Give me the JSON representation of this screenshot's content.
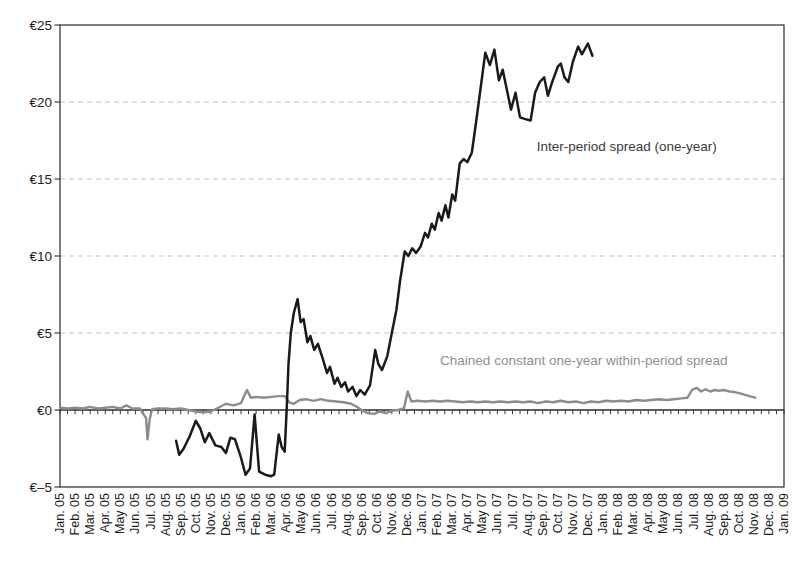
{
  "figure": {
    "background": "#ffffff"
  },
  "chart_data": {
    "type": "line",
    "title": "",
    "xlabel": "",
    "ylabel": "",
    "legend_position": "inline-annotations",
    "grid": "horizontal-dashed",
    "x_axis": {
      "unit": "month",
      "range_months": [
        0,
        48
      ],
      "minor_ticks_per_month": 2,
      "tick_labels": [
        "Jan. 05",
        "Feb. 05",
        "Mar. 05",
        "Apr. 05",
        "May 05",
        "Jun. 05",
        "Jul. 05",
        "Aug. 05",
        "Sep. 05",
        "Oct. 05",
        "Nov. 05",
        "Dec. 05",
        "Jan. 06",
        "Feb. 06",
        "Mar. 06",
        "Apr. 06",
        "May 06",
        "Jun. 06",
        "Jul. 06",
        "Aug. 06",
        "Sep. 06",
        "Oct. 06",
        "Nov. 06",
        "Dec. 06",
        "Jan. 07",
        "Feb. 07",
        "Mar. 07",
        "Apr. 07",
        "May 07",
        "Jun. 07",
        "Jul. 07",
        "Aug. 07",
        "Sep. 07",
        "Oct. 07",
        "Nov. 07",
        "Dec. 07",
        "Jan. 08",
        "Feb. 08",
        "Mar. 08",
        "Apr. 08",
        "May 08",
        "Jun. 08",
        "Jul. 08",
        "Aug. 08",
        "Sep. 08",
        "Oct. 08",
        "Nov. 08",
        "Dec. 08",
        "Jan. 09"
      ]
    },
    "y_axis": {
      "range": [
        -5,
        25
      ],
      "tick_values": [
        -5,
        0,
        5,
        10,
        15,
        20,
        25
      ],
      "tick_labels": [
        "€–5",
        "€0",
        "€5",
        "€10",
        "€15",
        "€20",
        "€25"
      ],
      "gridline_values": [
        5,
        10,
        15,
        20
      ],
      "zero_axis_value": 0
    },
    "series": [
      {
        "key": "within_period",
        "name": "Chained constant one-year within-period spread",
        "color": "#8c8c8c",
        "width": 2.4,
        "points": [
          [
            0,
            0.15
          ],
          [
            0.5,
            0.1
          ],
          [
            1,
            0.15
          ],
          [
            1.5,
            0.1
          ],
          [
            2,
            0.2
          ],
          [
            2.5,
            0.1
          ],
          [
            3,
            0.15
          ],
          [
            3.5,
            0.2
          ],
          [
            4,
            0.1
          ],
          [
            4.4,
            0.3
          ],
          [
            4.8,
            0.1
          ],
          [
            5.3,
            0.1
          ],
          [
            5.55,
            -0.3
          ],
          [
            5.7,
            -0.5
          ],
          [
            5.8,
            -1.9
          ],
          [
            5.95,
            -0.6
          ],
          [
            6.1,
            0.05
          ],
          [
            6.5,
            0.1
          ],
          [
            7,
            0.1
          ],
          [
            7.5,
            0.05
          ],
          [
            8,
            0.1
          ],
          [
            8.5,
            0
          ],
          [
            9,
            -0.1
          ],
          [
            9.5,
            -0.15
          ],
          [
            10,
            -0.1
          ],
          [
            10.5,
            0.15
          ],
          [
            11,
            0.4
          ],
          [
            11.5,
            0.3
          ],
          [
            12,
            0.45
          ],
          [
            12.4,
            1.3
          ],
          [
            12.65,
            0.8
          ],
          [
            13,
            0.85
          ],
          [
            13.5,
            0.8
          ],
          [
            14,
            0.85
          ],
          [
            14.5,
            0.9
          ],
          [
            14.9,
            0.9
          ],
          [
            15.2,
            0.5
          ],
          [
            15.5,
            0.4
          ],
          [
            15.9,
            0.65
          ],
          [
            16.3,
            0.7
          ],
          [
            16.8,
            0.6
          ],
          [
            17.3,
            0.7
          ],
          [
            17.8,
            0.6
          ],
          [
            18.3,
            0.55
          ],
          [
            18.8,
            0.5
          ],
          [
            19.3,
            0.4
          ],
          [
            19.7,
            0.2
          ],
          [
            20,
            0
          ],
          [
            20.4,
            -0.2
          ],
          [
            20.8,
            -0.25
          ],
          [
            21.2,
            -0.1
          ],
          [
            21.6,
            -0.2
          ],
          [
            22,
            -0.05
          ],
          [
            22.4,
            0
          ],
          [
            22.8,
            0.1
          ],
          [
            23.05,
            1.2
          ],
          [
            23.3,
            0.55
          ],
          [
            23.7,
            0.6
          ],
          [
            24.2,
            0.55
          ],
          [
            24.7,
            0.6
          ],
          [
            25.2,
            0.55
          ],
          [
            25.7,
            0.6
          ],
          [
            26.2,
            0.55
          ],
          [
            26.7,
            0.5
          ],
          [
            27.2,
            0.55
          ],
          [
            27.7,
            0.5
          ],
          [
            28.2,
            0.55
          ],
          [
            28.7,
            0.5
          ],
          [
            29.2,
            0.55
          ],
          [
            29.7,
            0.5
          ],
          [
            30.2,
            0.55
          ],
          [
            30.7,
            0.5
          ],
          [
            31.2,
            0.55
          ],
          [
            31.7,
            0.45
          ],
          [
            32.2,
            0.55
          ],
          [
            32.7,
            0.5
          ],
          [
            33.2,
            0.6
          ],
          [
            33.7,
            0.5
          ],
          [
            34.2,
            0.55
          ],
          [
            34.7,
            0.45
          ],
          [
            35.2,
            0.55
          ],
          [
            35.7,
            0.5
          ],
          [
            36.2,
            0.6
          ],
          [
            36.7,
            0.55
          ],
          [
            37.2,
            0.6
          ],
          [
            37.7,
            0.55
          ],
          [
            38.2,
            0.65
          ],
          [
            38.7,
            0.6
          ],
          [
            39.2,
            0.65
          ],
          [
            39.7,
            0.7
          ],
          [
            40.2,
            0.65
          ],
          [
            40.7,
            0.7
          ],
          [
            41.2,
            0.75
          ],
          [
            41.6,
            0.8
          ],
          [
            41.9,
            1.3
          ],
          [
            42.2,
            1.45
          ],
          [
            42.5,
            1.2
          ],
          [
            42.8,
            1.35
          ],
          [
            43.1,
            1.2
          ],
          [
            43.4,
            1.3
          ],
          [
            43.7,
            1.25
          ],
          [
            44,
            1.3
          ],
          [
            44.4,
            1.2
          ],
          [
            44.8,
            1.15
          ],
          [
            45.2,
            1.05
          ],
          [
            45.7,
            0.9
          ],
          [
            46.1,
            0.8
          ]
        ]
      },
      {
        "key": "inter_period",
        "name": "Inter-period spread (one-year)",
        "color": "#1a1a1a",
        "width": 2.5,
        "points": [
          [
            7.7,
            -2.0
          ],
          [
            7.9,
            -2.9
          ],
          [
            8.2,
            -2.5
          ],
          [
            8.6,
            -1.7
          ],
          [
            9,
            -0.7
          ],
          [
            9.3,
            -1.2
          ],
          [
            9.6,
            -2.1
          ],
          [
            9.9,
            -1.5
          ],
          [
            10.3,
            -2.3
          ],
          [
            10.7,
            -2.4
          ],
          [
            11,
            -2.8
          ],
          [
            11.3,
            -1.8
          ],
          [
            11.6,
            -1.9
          ],
          [
            12,
            -3.1
          ],
          [
            12.3,
            -4.2
          ],
          [
            12.6,
            -3.8
          ],
          [
            12.9,
            -0.3
          ],
          [
            13.2,
            -4.0
          ],
          [
            13.6,
            -4.2
          ],
          [
            14,
            -4.3
          ],
          [
            14.2,
            -4.2
          ],
          [
            14.5,
            -1.6
          ],
          [
            14.7,
            -2.4
          ],
          [
            14.9,
            -2.7
          ],
          [
            15.05,
            0.5
          ],
          [
            15.15,
            3.0
          ],
          [
            15.3,
            5.0
          ],
          [
            15.5,
            6.3
          ],
          [
            15.75,
            7.2
          ],
          [
            15.95,
            5.7
          ],
          [
            16.15,
            5.9
          ],
          [
            16.4,
            4.4
          ],
          [
            16.6,
            4.8
          ],
          [
            16.85,
            3.9
          ],
          [
            17.1,
            4.3
          ],
          [
            17.4,
            3.4
          ],
          [
            17.7,
            2.4
          ],
          [
            17.9,
            2.8
          ],
          [
            18.2,
            1.7
          ],
          [
            18.4,
            2.1
          ],
          [
            18.65,
            1.5
          ],
          [
            18.9,
            1.8
          ],
          [
            19.1,
            1.2
          ],
          [
            19.4,
            1.5
          ],
          [
            19.65,
            0.9
          ],
          [
            19.9,
            1.3
          ],
          [
            20.2,
            1.0
          ],
          [
            20.55,
            1.6
          ],
          [
            20.9,
            3.9
          ],
          [
            21.1,
            3.0
          ],
          [
            21.35,
            2.6
          ],
          [
            21.7,
            3.5
          ],
          [
            22,
            5.0
          ],
          [
            22.3,
            6.5
          ],
          [
            22.55,
            8.4
          ],
          [
            22.85,
            10.3
          ],
          [
            23.1,
            10.0
          ],
          [
            23.35,
            10.5
          ],
          [
            23.6,
            10.2
          ],
          [
            23.9,
            10.6
          ],
          [
            24.2,
            11.5
          ],
          [
            24.4,
            11.2
          ],
          [
            24.65,
            12.1
          ],
          [
            24.85,
            11.7
          ],
          [
            25.1,
            12.8
          ],
          [
            25.3,
            12.3
          ],
          [
            25.55,
            13.3
          ],
          [
            25.75,
            12.5
          ],
          [
            26,
            14.0
          ],
          [
            26.2,
            13.6
          ],
          [
            26.5,
            16.0
          ],
          [
            26.75,
            16.3
          ],
          [
            27,
            16.1
          ],
          [
            27.3,
            16.7
          ],
          [
            27.6,
            18.8
          ],
          [
            27.9,
            21.0
          ],
          [
            28.2,
            23.2
          ],
          [
            28.5,
            22.4
          ],
          [
            28.8,
            23.4
          ],
          [
            29.1,
            21.4
          ],
          [
            29.35,
            22.1
          ],
          [
            29.6,
            20.9
          ],
          [
            29.9,
            19.5
          ],
          [
            30.2,
            20.6
          ],
          [
            30.5,
            19.0
          ],
          [
            30.8,
            18.9
          ],
          [
            31.2,
            18.8
          ],
          [
            31.5,
            20.6
          ],
          [
            31.8,
            21.3
          ],
          [
            32.1,
            21.6
          ],
          [
            32.35,
            20.4
          ],
          [
            32.6,
            21.2
          ],
          [
            33,
            22.3
          ],
          [
            33.2,
            22.5
          ],
          [
            33.45,
            21.6
          ],
          [
            33.7,
            21.3
          ],
          [
            34,
            22.6
          ],
          [
            34.35,
            23.6
          ],
          [
            34.6,
            23.1
          ],
          [
            35,
            23.8
          ],
          [
            35.3,
            23.0
          ]
        ]
      }
    ],
    "annotations": [
      {
        "id": "inter_period",
        "text": "Inter-period spread (one-year)",
        "color": "#3a3a3a",
        "t": 31.6,
        "value": 16.8,
        "anchor": "start"
      },
      {
        "id": "within_period",
        "text": "Chained constant one-year within-period spread",
        "color": "#8f8f8f",
        "t": 25.2,
        "value": 2.9,
        "anchor": "start"
      }
    ],
    "styles": {
      "frame_color": "#3a3a3a",
      "zero_axis_color": "#2b2b2b",
      "gridline_color": "#c4c4c4",
      "tick_color": "#3a3a3a",
      "label_color": "#1c1c1c",
      "axis_font_px": 11.5,
      "annotation_font_px": 13.5
    },
    "layout": {
      "width": 811,
      "height": 564,
      "plot": {
        "left": 60,
        "top": 25,
        "right": 784,
        "bottom": 487
      },
      "x_label_top": 493,
      "y_label_right": 52
    }
  }
}
